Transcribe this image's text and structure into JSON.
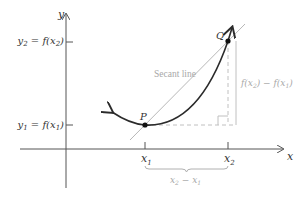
{
  "diagram": {
    "axes": {
      "x_label": "x",
      "y_label": "y"
    },
    "points": {
      "P": {
        "label": "P"
      },
      "Q": {
        "label": "Q"
      }
    },
    "y_ticks": {
      "y2": {
        "sym": "y",
        "sub": "2",
        "eq": " = f(x",
        "sub2": "2",
        "close": ")"
      },
      "y1": {
        "sym": "y",
        "sub": "1",
        "eq": " = f(x",
        "sub2": "1",
        "close": ")"
      }
    },
    "x_ticks": {
      "x1": {
        "sym": "x",
        "sub": "1"
      },
      "x2": {
        "sym": "x",
        "sub": "2"
      }
    },
    "secant_label": "Secant line",
    "rise_label": {
      "a": "f(x",
      "a_sub": "2",
      "mid": ") − f(x",
      "b_sub": "1",
      "end": ")"
    },
    "run_label": {
      "a": "x",
      "a_sub": "2",
      "mid": " − x",
      "b_sub": "1"
    },
    "colors": {
      "curve": "#2b2b2b",
      "axis": "#555555",
      "secant": "#b8b8b8",
      "guide": "#c0c0c0",
      "label_gray": "#a8a8a8"
    }
  }
}
